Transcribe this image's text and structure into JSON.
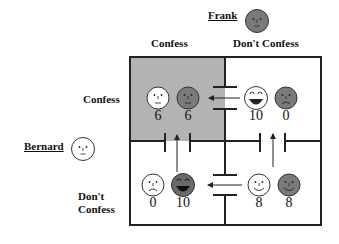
{
  "players": {
    "column": {
      "name": "Frank",
      "face_color": "#7a7a7a"
    },
    "row": {
      "name": "Bernard",
      "face_color": "#ffffff"
    }
  },
  "column_headers": [
    "Confess",
    "Don't Confess"
  ],
  "row_headers": [
    "Confess",
    "Don't\nConfess"
  ],
  "row_header_lines": {
    "dont_1": "Don't",
    "dont_2": "Confess"
  },
  "cells": [
    {
      "id": "confess-confess",
      "bernard": "6",
      "frank": "6",
      "bernard_face": "neutral",
      "frank_face": "neutral",
      "highlighted": true
    },
    {
      "id": "confess-dontconfess",
      "bernard": "10",
      "frank": "0",
      "bernard_face": "big-grin",
      "frank_face": "frown"
    },
    {
      "id": "dontconfess-confess",
      "bernard": "0",
      "frank": "10",
      "bernard_face": "frown",
      "frank_face": "big-grin"
    },
    {
      "id": "dontconfess-dontconfess",
      "bernard": "8",
      "frank": "8",
      "bernard_face": "smile",
      "frank_face": "smile"
    }
  ],
  "colors": {
    "highlight": "#b3b3b3",
    "frank_face": "#7a7a7a",
    "line": "#222222"
  },
  "arrows": [
    {
      "from": "confess-dontconfess",
      "to": "confess-confess"
    },
    {
      "from": "dontconfess-confess",
      "to": "confess-confess"
    },
    {
      "from": "dontconfess-dontconfess",
      "to": "confess-dontconfess"
    },
    {
      "from": "dontconfess-dontconfess",
      "to": "dontconfess-confess"
    }
  ]
}
